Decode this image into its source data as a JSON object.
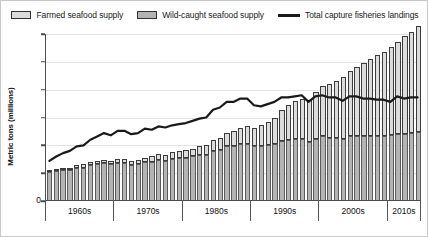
{
  "legend": {
    "items": [
      {
        "label": "Farmed seafood supply",
        "type": "swatch",
        "color": "#dcdcdc"
      },
      {
        "label": "Wild-caught seafood supply",
        "type": "swatch",
        "color": "#b4b4b4"
      },
      {
        "label": "Total capture fisheries landings",
        "type": "line",
        "color": "#1a1a1a"
      }
    ]
  },
  "axes": {
    "y_title": "Metric tons (millions)",
    "y_ticks": [
      0,
      25,
      50,
      75,
      100,
      125,
      150
    ],
    "y_min": 0,
    "y_max": 150,
    "x_groups": [
      "1960s",
      "1970s",
      "1980s",
      "1990s",
      "2000s",
      "2010s"
    ]
  },
  "chart_data": {
    "type": "bar",
    "title": "",
    "subtitle": "",
    "xlabel": "",
    "ylabel": "Metric tons (millions)",
    "ylim": [
      0,
      150
    ],
    "grid": true,
    "legend_position": "top",
    "stacked": true,
    "x": [
      1960,
      1961,
      1962,
      1963,
      1964,
      1965,
      1966,
      1967,
      1968,
      1969,
      1970,
      1971,
      1972,
      1973,
      1974,
      1975,
      1976,
      1977,
      1978,
      1979,
      1980,
      1981,
      1982,
      1983,
      1984,
      1985,
      1986,
      1987,
      1988,
      1989,
      1990,
      1991,
      1992,
      1993,
      1994,
      1995,
      1996,
      1997,
      1998,
      1999,
      2000,
      2001,
      2002,
      2003,
      2004,
      2005,
      2006,
      2007,
      2008,
      2009,
      2010,
      2011,
      2012,
      2013,
      2014
    ],
    "x_group_labels": [
      "1960s",
      "1970s",
      "1980s",
      "1990s",
      "2000s",
      "2010s"
    ],
    "series": [
      {
        "name": "Wild-caught seafood supply",
        "color": "#b4b4b4",
        "values": [
          26,
          27,
          28,
          28,
          30,
          30,
          32,
          33,
          34,
          33,
          34,
          34,
          32,
          33,
          35,
          35,
          37,
          36,
          38,
          39,
          39,
          40,
          41,
          41,
          45,
          46,
          49,
          49,
          51,
          51,
          49,
          49,
          50,
          51,
          54,
          55,
          56,
          56,
          53,
          56,
          58,
          57,
          57,
          56,
          58,
          58,
          58,
          58,
          58,
          58,
          59,
          60,
          60,
          61,
          62
        ]
      },
      {
        "name": "Farmed seafood supply",
        "color": "#dcdcdc",
        "values": [
          2,
          2,
          2,
          2,
          2,
          3,
          3,
          3,
          3,
          3,
          4,
          4,
          4,
          4,
          4,
          5,
          5,
          5,
          6,
          6,
          7,
          7,
          8,
          9,
          10,
          11,
          12,
          14,
          15,
          16,
          17,
          19,
          21,
          24,
          28,
          31,
          34,
          36,
          38,
          42,
          45,
          48,
          51,
          55,
          59,
          62,
          66,
          70,
          73,
          76,
          79,
          83,
          88,
          91,
          95
        ]
      }
    ],
    "line_series": {
      "name": "Total capture fisheries landings",
      "color": "#1a1a1a",
      "values": [
        36,
        40,
        43,
        45,
        49,
        50,
        55,
        58,
        61,
        59,
        63,
        63,
        60,
        61,
        65,
        64,
        67,
        66,
        68,
        69,
        70,
        72,
        74,
        75,
        82,
        84,
        89,
        89,
        92,
        92,
        86,
        85,
        87,
        89,
        93,
        93,
        94,
        95,
        89,
        94,
        95,
        93,
        93,
        90,
        94,
        94,
        92,
        92,
        91,
        91,
        89,
        94,
        92,
        93,
        93
      ]
    }
  }
}
